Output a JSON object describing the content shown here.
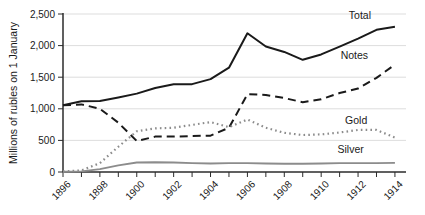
{
  "chart_data": {
    "type": "line",
    "title": "",
    "subtitle": "",
    "xlabel": "",
    "ylabel": "Millions of rubles on 1 January",
    "x": [
      1896,
      1897,
      1898,
      1899,
      1900,
      1901,
      1902,
      1903,
      1904,
      1905,
      1906,
      1907,
      1908,
      1909,
      1910,
      1911,
      1912,
      1913,
      1914
    ],
    "xlim": [
      1896,
      1914.6
    ],
    "ylim": [
      0,
      2500
    ],
    "yticks": [
      0,
      500,
      1000,
      1500,
      2000,
      2500
    ],
    "ytick_labels": [
      "0",
      "500",
      "1,000",
      "1,500",
      "2,000",
      "2,500"
    ],
    "xtick_values": [
      1896,
      1898,
      1900,
      1902,
      1904,
      1906,
      1908,
      1910,
      1912,
      1914
    ],
    "xtick_labels": [
      "1896",
      "1898",
      "1900",
      "1902",
      "1904",
      "1906",
      "1908",
      "1910",
      "1912",
      "1914"
    ],
    "xtick_minor_every_year": true,
    "grid": "horizontal",
    "legend_position": "inline-right-of-line-ends",
    "series": [
      {
        "name": "Total",
        "label": "Total",
        "style": "solid",
        "color": "#1a1a1a",
        "width": 2.0,
        "values": [
          1055,
          1120,
          1125,
          1180,
          1240,
          1330,
          1390,
          1390,
          1470,
          1650,
          2195,
          1985,
          1900,
          1775,
          1860,
          1985,
          2110,
          2250,
          2300
        ]
      },
      {
        "name": "Notes",
        "label": "Notes",
        "style": "dashed",
        "color": "#1a1a1a",
        "width": 2.0,
        "values": [
          1055,
          1070,
          1000,
          780,
          490,
          560,
          560,
          570,
          575,
          700,
          1230,
          1220,
          1170,
          1105,
          1150,
          1250,
          1320,
          1490,
          1700
        ]
      },
      {
        "name": "Gold",
        "label": "Gold",
        "style": "dotted",
        "color": "#8c8c8c",
        "width": 2.2,
        "values": [
          10,
          25,
          140,
          400,
          645,
          690,
          700,
          745,
          790,
          710,
          830,
          700,
          620,
          585,
          595,
          625,
          665,
          665,
          545
        ]
      },
      {
        "name": "Silver",
        "label": "Silver",
        "style": "solid",
        "color": "#8c8c8c",
        "width": 1.9,
        "values": [
          5,
          10,
          45,
          105,
          150,
          155,
          150,
          140,
          135,
          140,
          140,
          135,
          130,
          130,
          135,
          140,
          140,
          140,
          145
        ]
      }
    ],
    "series_label_anchors": [
      {
        "name": "Total",
        "x": 1912.1,
        "y": 2420
      },
      {
        "name": "Notes",
        "x": 1911.8,
        "y": 1790
      },
      {
        "name": "Gold",
        "x": 1911.9,
        "y": 755
      },
      {
        "name": "Silver",
        "x": 1911.6,
        "y": 300
      }
    ]
  }
}
